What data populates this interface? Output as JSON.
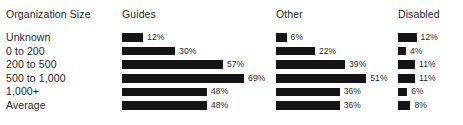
{
  "chart_data": {
    "type": "bar",
    "title": "",
    "xlabel": "",
    "ylabel": "",
    "orientation": "horizontal",
    "grid": false,
    "legend_position": "none",
    "value_suffix": "%",
    "xlim": [
      0,
      100
    ],
    "row_header": "Organization Size",
    "categories": [
      "Unknown",
      "0 to 200",
      "200 to 500",
      "500 to 1,000",
      "1,000+",
      "Average"
    ],
    "series": [
      {
        "name": "Guides",
        "values": [
          12,
          30,
          57,
          69,
          48,
          48
        ]
      },
      {
        "name": "Other",
        "values": [
          6,
          22,
          39,
          51,
          36,
          36
        ]
      },
      {
        "name": "Disabled",
        "values": [
          12,
          4,
          11,
          11,
          6,
          8
        ]
      }
    ],
    "bar_color": "#141414",
    "text_color": "#1f1f1f",
    "background": "#ffffff"
  },
  "header": {
    "org": "Organization Size",
    "guides": "Guides",
    "other": "Other",
    "disabled": "Disabled"
  },
  "rows": [
    {
      "label": "Unknown",
      "guides": "12%",
      "other": "6%",
      "disabled": "12%"
    },
    {
      "label": "0 to 200",
      "guides": "30%",
      "other": "22%",
      "disabled": "4%"
    },
    {
      "label": "200 to 500",
      "guides": "57%",
      "other": "39%",
      "disabled": "11%"
    },
    {
      "label": "500 to 1,000",
      "guides": "69%",
      "other": "51%",
      "disabled": "11%"
    },
    {
      "label": "1,000+",
      "guides": "48%",
      "other": "36%",
      "disabled": "6%"
    },
    {
      "label": "Average",
      "guides": "48%",
      "other": "36%",
      "disabled": "8%"
    }
  ]
}
